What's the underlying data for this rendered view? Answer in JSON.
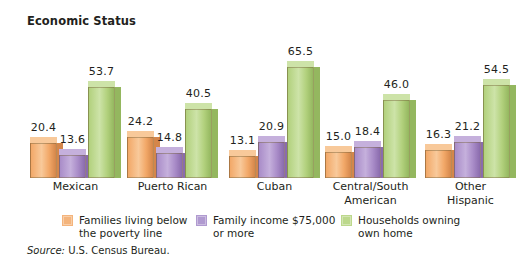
{
  "chart_data": {
    "type": "bar",
    "title": "Economic Status",
    "xlabel": "",
    "ylabel": "",
    "ylim": [
      0,
      70
    ],
    "grid": false,
    "legend_position": "bottom",
    "value_labels": true,
    "source": {
      "label": "Source:",
      "text": "U.S. Census Bureau."
    },
    "categories": [
      "Mexican",
      "Puerto Rican",
      "Cuban",
      "Central/South\nAmerican",
      "Other\nHispanic"
    ],
    "series": [
      {
        "name": "Families living below\nthe poverty line",
        "color": "#F2A868",
        "top_color": "#F8C99A",
        "side_color": "#D4864A",
        "values": [
          20.4,
          24.2,
          13.1,
          15.0,
          16.3
        ],
        "value_labels": [
          "20.4",
          "24.2",
          "13.1",
          "15.0",
          "16.3"
        ]
      },
      {
        "name": "Family income $75,000\nor more",
        "color": "#A98CC8",
        "top_color": "#C5B0DC",
        "side_color": "#8A6BAD",
        "values": [
          13.6,
          14.8,
          20.9,
          18.4,
          21.2
        ],
        "value_labels": [
          "13.6",
          "14.8",
          "20.9",
          "18.4",
          "21.2"
        ]
      },
      {
        "name": "Households owning\nown home",
        "color": "#B2D17D",
        "top_color": "#CDE3A8",
        "side_color": "#94B75F",
        "values": [
          53.7,
          40.5,
          65.5,
          46.0,
          54.5
        ],
        "value_labels": [
          "53.7",
          "40.5",
          "65.5",
          "46.0",
          "54.5"
        ]
      }
    ]
  },
  "legend": [
    {
      "label": "Families living below\nthe poverty line",
      "color": "#F4B47C"
    },
    {
      "label": "Family income $75,000\nor more",
      "color": "#B09AD0"
    },
    {
      "label": "Households owning\nown home",
      "color": "#BCD88C"
    }
  ]
}
